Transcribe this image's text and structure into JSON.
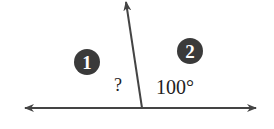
{
  "diagram": {
    "type": "adjacent angles on a straight line",
    "markers": [
      {
        "id": "1",
        "label": "1"
      },
      {
        "id": "2",
        "label": "2"
      }
    ],
    "angles": {
      "unknown": "?",
      "known": "100°"
    },
    "colors": {
      "line": "#444444",
      "marker_fill": "#3a3a3a",
      "marker_text": "#ffffff",
      "text": "#222222"
    }
  }
}
